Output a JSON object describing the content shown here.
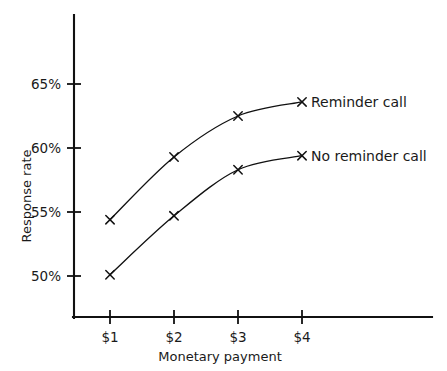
{
  "chart_data": {
    "type": "line",
    "title": "",
    "xlabel": "Monetary payment",
    "ylabel": "Response rate",
    "categories": [
      "$1",
      "$2",
      "$3",
      "$4"
    ],
    "x": [
      1,
      2,
      3,
      4
    ],
    "series": [
      {
        "name": "Reminder call",
        "values": [
          54.4,
          59.3,
          62.5,
          63.6
        ],
        "marker": "x",
        "color": "#111111"
      },
      {
        "name": "No reminder call",
        "values": [
          50.1,
          54.7,
          58.3,
          59.4
        ],
        "marker": "x",
        "color": "#111111"
      }
    ],
    "ytick_labels": [
      "65%",
      "60%",
      "55%",
      "50%"
    ],
    "ytick_values": [
      65,
      60,
      55,
      50
    ],
    "xtick_labels": [
      "$1",
      "$2",
      "$3",
      "$4"
    ],
    "ylim": [
      48.4,
      69.6
    ],
    "xlim": [
      0.55,
      5.6
    ],
    "grid": false,
    "legend_position": "inline-right-of-last-point",
    "background_color": "#ffffff",
    "axis_color": "#111111"
  },
  "axes": {
    "y_title": "Response rate",
    "x_title": "Monetary payment",
    "y_ticks": [
      {
        "label": "65%",
        "value": 65
      },
      {
        "label": "60%",
        "value": 60
      },
      {
        "label": "55%",
        "value": 55
      },
      {
        "label": "50%",
        "value": 50
      }
    ],
    "x_ticks": [
      {
        "label": "$1",
        "value": 1
      },
      {
        "label": "$2",
        "value": 2
      },
      {
        "label": "$3",
        "value": 3
      },
      {
        "label": "$4",
        "value": 4
      }
    ]
  },
  "series_labels": {
    "reminder": "Reminder call",
    "no_reminder": "No reminder call"
  }
}
